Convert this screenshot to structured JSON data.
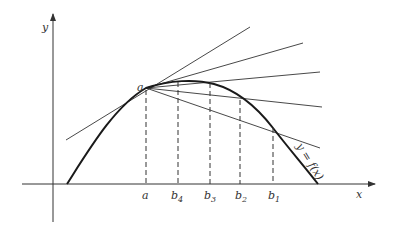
{
  "diagram": {
    "title": "",
    "axes": {
      "x_label": "x",
      "y_label": "y"
    },
    "point_a_label": "a",
    "curve_label": "y = f(x)",
    "x_ticks": [
      {
        "id": "a",
        "main": "a",
        "sub": ""
      },
      {
        "id": "b4",
        "main": "b",
        "sub": "4"
      },
      {
        "id": "b3",
        "main": "b",
        "sub": "3"
      },
      {
        "id": "b2",
        "main": "b",
        "sub": "2"
      },
      {
        "id": "b1",
        "main": "b",
        "sub": "1"
      }
    ],
    "colors": {
      "line": "#333333",
      "curve": "#1a1a1a",
      "background": "#ffffff"
    }
  }
}
